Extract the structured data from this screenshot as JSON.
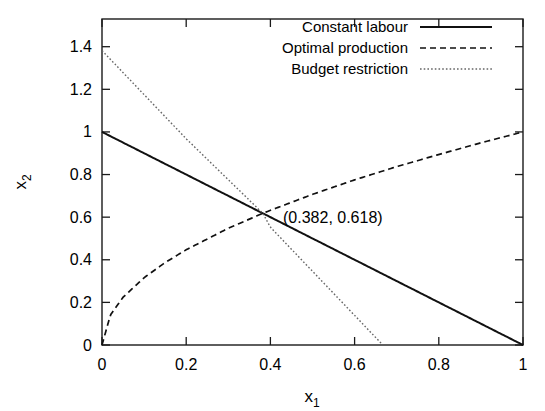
{
  "chart_data": {
    "type": "line",
    "title": "",
    "xlabel": "x_1",
    "ylabel": "x_2",
    "xlabel_base": "x",
    "xlabel_sub": "1",
    "ylabel_base": "x",
    "ylabel_sub": "2",
    "xlim": [
      0,
      1
    ],
    "ylim": [
      0,
      1.53
    ],
    "grid": false,
    "legend_position": "top-right inside",
    "xticks": [
      0,
      0.2,
      0.4,
      0.6,
      0.8,
      1
    ],
    "xticklabels": [
      "0",
      "0.2",
      "0.4",
      "0.6",
      "0.8",
      "1"
    ],
    "yticks": [
      0,
      0.2,
      0.4,
      0.6,
      0.8,
      1,
      1.2,
      1.4
    ],
    "yticklabels": [
      "0",
      "0.2",
      "0.4",
      "0.6",
      "0.8",
      "1",
      "1.2",
      "1.4"
    ],
    "annotations": [
      {
        "text": "(0.382, 0.618)",
        "x": 0.43,
        "y": 0.6,
        "describes": "common intersection point of the three curves"
      }
    ],
    "series": [
      {
        "name": "Constant labour",
        "style": "solid",
        "color": "#111111",
        "formula": "x2 = 1 - x1",
        "x": [
          0,
          0.1,
          0.2,
          0.3,
          0.382,
          0.4,
          0.5,
          0.6,
          0.7,
          0.8,
          0.9,
          1
        ],
        "values": [
          1,
          0.9,
          0.8,
          0.7,
          0.618,
          0.6,
          0.5,
          0.4,
          0.3,
          0.2,
          0.1,
          0
        ]
      },
      {
        "name": "Optimal production",
        "style": "dashed",
        "color": "#111111",
        "formula": "x2 = sqrt(x1)",
        "x": [
          0,
          0.02,
          0.05,
          0.1,
          0.15,
          0.2,
          0.3,
          0.382,
          0.4,
          0.5,
          0.6,
          0.7,
          0.8,
          0.9,
          1
        ],
        "values": [
          0,
          0.141,
          0.224,
          0.316,
          0.387,
          0.447,
          0.548,
          0.618,
          0.632,
          0.707,
          0.775,
          0.837,
          0.894,
          0.949,
          1
        ]
      },
      {
        "name": "Budget restriction",
        "style": "dotted",
        "color": "#666666",
        "formula": "x2 = 1.382 - 2.072 * x1",
        "x": [
          0,
          0.2,
          0.382,
          0.4,
          0.6,
          0.667
        ],
        "values": [
          1.382,
          0.968,
          0.618,
          0.553,
          0.139,
          0
        ]
      }
    ]
  },
  "legend": {
    "entries": [
      {
        "label": "Constant labour",
        "style": "solid"
      },
      {
        "label": "Optimal production",
        "style": "dashed"
      },
      {
        "label": "Budget restriction",
        "style": "dotted"
      }
    ]
  }
}
